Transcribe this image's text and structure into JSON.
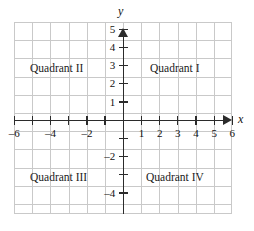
{
  "figure": {
    "type": "coordinate-plane"
  },
  "axes": {
    "x_label": "x",
    "y_label": "y",
    "x_range": [
      -6.5,
      6.5
    ],
    "y_range": [
      -5.5,
      5.5
    ],
    "grid": true,
    "grid_color": "#c9c9c9",
    "axis_color": "#2b2b2b"
  },
  "ticks": {
    "x_values": [
      -6,
      -5,
      -4,
      -3,
      -2,
      -1,
      1,
      2,
      3,
      4,
      5,
      6
    ],
    "x_labels": [
      {
        "value": -6,
        "text": "–6"
      },
      {
        "value": -4,
        "text": "–4"
      },
      {
        "value": -2,
        "text": "–2"
      },
      {
        "value": 1,
        "text": "1"
      },
      {
        "value": 2,
        "text": "2"
      },
      {
        "value": 3,
        "text": "3"
      },
      {
        "value": 4,
        "text": "4"
      },
      {
        "value": 5,
        "text": "5"
      },
      {
        "value": 6,
        "text": "6"
      }
    ],
    "y_values": [
      -4,
      -3,
      -2,
      -1,
      1,
      2,
      3,
      4,
      5
    ],
    "y_labels": [
      {
        "value": 5,
        "text": "5"
      },
      {
        "value": 4,
        "text": "4"
      },
      {
        "value": 3,
        "text": "3"
      },
      {
        "value": 2,
        "text": "2"
      },
      {
        "value": 1,
        "text": "1"
      },
      {
        "value": -2,
        "text": "–2"
      },
      {
        "value": -4,
        "text": "–4"
      }
    ]
  },
  "quadrants": {
    "q1": "Quadrant I",
    "q2": "Quadrant II",
    "q3": "Quadrant III",
    "q4": "Quadrant IV"
  },
  "chart_data": {
    "type": "scatter",
    "title": "",
    "xlabel": "x",
    "ylabel": "y",
    "xlim": [
      -6.5,
      6.5
    ],
    "ylim": [
      -5.5,
      5.5
    ],
    "grid": true,
    "legend": "none",
    "series": [],
    "annotations": [
      {
        "text": "Quadrant I",
        "x": 3.5,
        "y": 3.2
      },
      {
        "text": "Quadrant II",
        "x": -3.6,
        "y": 3.2
      },
      {
        "text": "Quadrant III",
        "x": -3.6,
        "y": -3.0
      },
      {
        "text": "Quadrant IV",
        "x": 3.3,
        "y": -3.0
      }
    ]
  }
}
